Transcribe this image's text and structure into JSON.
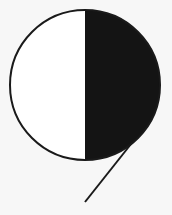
{
  "symbol": {
    "description": "Half-filled circle with diagonal tail",
    "colors": {
      "background": "#f7f7f7",
      "fill_dark": "#141414",
      "fill_light": "#ffffff",
      "stroke": "#1a1a1a"
    },
    "circle": {
      "cx": 85,
      "cy": 85,
      "r": 75
    },
    "tail": {
      "x1": 131,
      "y1": 144,
      "x2": 85,
      "y2": 202
    }
  }
}
